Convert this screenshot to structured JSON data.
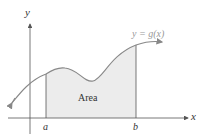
{
  "diagram": {
    "axes": {
      "x_label": "x",
      "y_label": "y"
    },
    "curve_label": "y = g(x)",
    "region_label": "Area",
    "bounds": {
      "lower": "a",
      "upper": "b"
    },
    "colors": {
      "curve": "#8a8a8a",
      "curve_label": "#999999",
      "region_fill": "#ececec",
      "axis": "#444444"
    }
  }
}
